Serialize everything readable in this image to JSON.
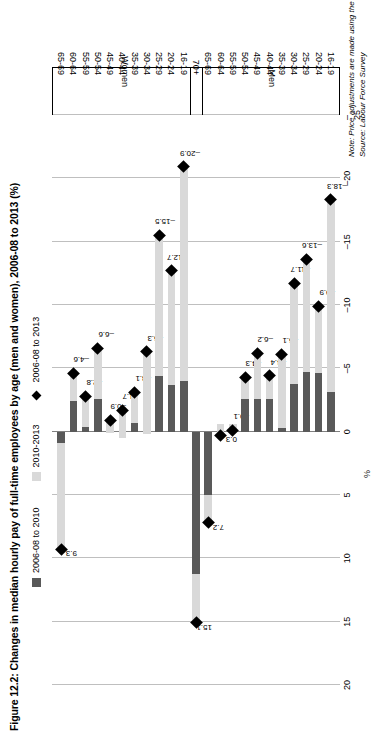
{
  "figure": {
    "title": "Figure 12.2: Changes in median hourly pay of full-time employees by age (men and women), 2006-08 to 2013 (%)",
    "note": "Note: Price adjustments are made using the consumer prices index (CPI)",
    "source": "Source: Labour Force Survey"
  },
  "legend": {
    "items": [
      {
        "label": "2006-08 to 2010",
        "swatch": "dark-square-swatch",
        "color": "#595959"
      },
      {
        "label": "2010-2013",
        "swatch": "light-square-swatch",
        "color": "#d9d9d9"
      },
      {
        "label": "2006-08 to 2013",
        "swatch": "black-diamond-marker",
        "color": "#000000"
      }
    ]
  },
  "groups": [
    {
      "name": "Women"
    },
    {
      "name": "Men"
    }
  ],
  "chart_data": {
    "type": "bar",
    "title": "Figure 12.2: Changes in median hourly pay of full-time employees by age (men and women), 2006-08 to 2013 (%)",
    "orientation": "horizontal-stacked",
    "xlabel": "%",
    "ylabel": "",
    "xlim": [
      -25,
      20
    ],
    "xticks": [
      20,
      15,
      10,
      5,
      0,
      -5,
      -10,
      -15,
      -20,
      -25
    ],
    "grid": true,
    "legend_position": "top",
    "categories": [
      "Women 65-69",
      "Women 60-64",
      "Women 55-59",
      "Women 50-54",
      "Women 45-49",
      "Women 40-44",
      "Women 35-39",
      "Women 30-34",
      "Women 25-29",
      "Women 20-24",
      "Women 16-19",
      "70+",
      "Men 65-69",
      "Men 60-64",
      "Men 55-59",
      "Men 50-54",
      "Men 45-49",
      "Men 40-44",
      "Men 35-39",
      "Men 30-34",
      "Men 25-29",
      "Men 20-24",
      "Men 16-19"
    ],
    "category_labels": [
      "65-69",
      "60-64",
      "55-59",
      "50-54",
      "45-49",
      "40-44",
      "35-39",
      "30-34",
      "25-29",
      "20-24",
      "16-19",
      "70+",
      "65-69",
      "60-64",
      "55-59",
      "50-54",
      "45-49",
      "40-44",
      "35-39",
      "30-34",
      "25-29",
      "20-24",
      "16-19"
    ],
    "series": [
      {
        "name": "2006-08 to 2010",
        "values": [
          0.9,
          -2.4,
          -0.4,
          -2.6,
          0.1,
          0.5,
          -0.7,
          0.2,
          -4.4,
          -3.7,
          -4.0,
          11.2,
          5.0,
          -0.6,
          -0.6,
          -2.6,
          -2.6,
          -2.6,
          -0.3,
          -3.8,
          -4.7,
          -4.6,
          -3.1
        ]
      },
      {
        "name": "2010-2013",
        "values": [
          8.4,
          -2.2,
          -2.4,
          -4.0,
          -1.0,
          -2.2,
          -2.4,
          -6.5,
          -11.1,
          -9.0,
          -16.9,
          3.9,
          2.2,
          0.9,
          0.5,
          -1.7,
          -3.6,
          -1.8,
          -5.8,
          -7.9,
          -8.9,
          -5.3,
          -15.2
        ]
      }
    ],
    "markers": {
      "name": "2006-08 to 2013",
      "values": [
        9.3,
        -4.6,
        -2.8,
        -6.6,
        -0.9,
        -1.7,
        -3.1,
        -6.3,
        -15.5,
        -12.7,
        -20.9,
        15.1,
        7.2,
        0.3,
        -0.1,
        -4.3,
        -6.2,
        -4.4,
        -6.1,
        -11.7,
        -13.6,
        -9.9,
        -18.3
      ]
    },
    "marker_labels": [
      "9.3",
      "–4.6",
      "–2.8",
      "–6.6",
      "–0.9",
      "–1.7",
      "–3.1",
      "–6.3",
      "–15.5",
      "–12.7",
      "–20.9",
      "15.1",
      "7.2",
      "0.3",
      "–0.1",
      "–4.3",
      "–6.2",
      "–4.4",
      "–6.1",
      "–11.7",
      "–13.6",
      "–9.9",
      "–18.3"
    ]
  }
}
